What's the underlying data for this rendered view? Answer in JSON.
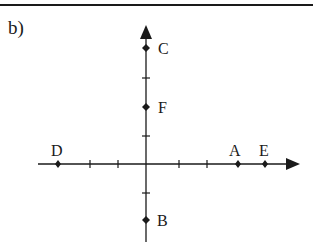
{
  "part_label": "b)",
  "diagram": {
    "type": "coordinate-axes",
    "origin_px": [
      146,
      164
    ],
    "unit_px": 29,
    "x_axis": {
      "ticks": [
        -3,
        -2,
        -1,
        1,
        2,
        3,
        4
      ],
      "arrow": "right"
    },
    "y_axis": {
      "ticks": [
        -2,
        -1,
        1,
        2,
        3,
        4
      ],
      "arrow": "up"
    },
    "points": [
      {
        "label": "A",
        "x": 3,
        "y": 0
      },
      {
        "label": "B",
        "x": 0,
        "y": -2
      },
      {
        "label": "C",
        "x": 0,
        "y": 4
      },
      {
        "label": "D",
        "x": -3,
        "y": 0
      },
      {
        "label": "E",
        "x": 4,
        "y": 0
      },
      {
        "label": "F",
        "x": 0,
        "y": 2
      }
    ]
  },
  "labels": {
    "A": "A",
    "B": "B",
    "C": "C",
    "D": "D",
    "E": "E",
    "F": "F"
  },
  "colors": {
    "ink": "#1a1a1a",
    "background": "#ffffff"
  }
}
